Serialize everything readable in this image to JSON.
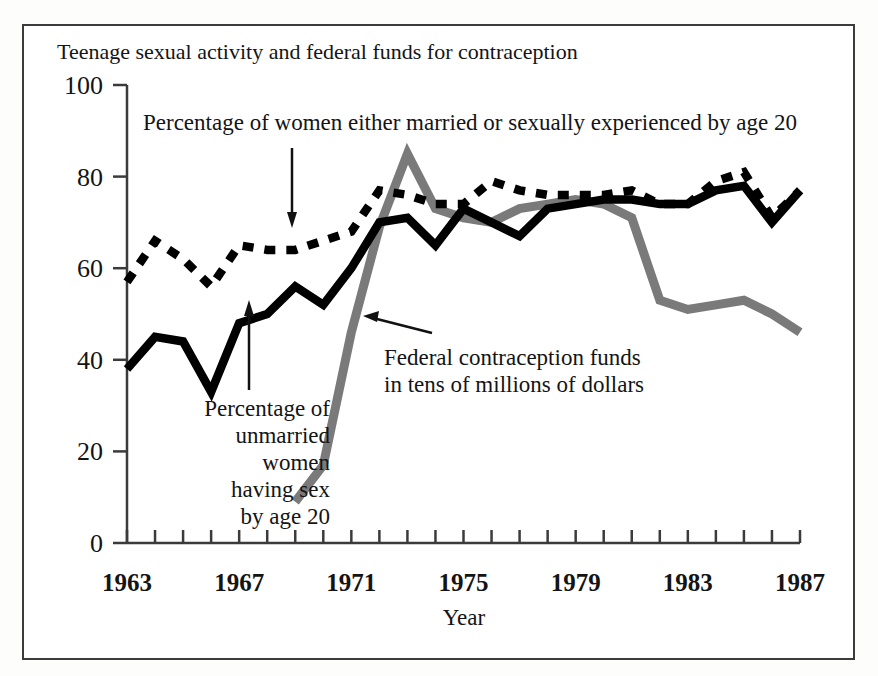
{
  "figure": {
    "title": "Teenage sexual activity and federal funds for contraception",
    "xlabel": "Year",
    "background_color": "#ffffff",
    "frame_color": "#3b3b3b"
  },
  "annotations": {
    "married_label_line1": "Percentage of women either married or sexually experienced by age 20",
    "unmarried_label_line1": "Percentage of",
    "unmarried_label_line2": "unmarried",
    "unmarried_label_line3": "women",
    "unmarried_label_line4": "having sex",
    "unmarried_label_line5": "by age 20",
    "funds_label_line1": "Federal contraception funds",
    "funds_label_line2": "in tens of millions of dollars"
  },
  "axis": {
    "y_ticks": [
      "0",
      "20",
      "40",
      "60",
      "80",
      "100"
    ],
    "y_tick_values": [
      0,
      20,
      40,
      60,
      80,
      100
    ],
    "x_ticks": [
      "1963",
      "1967",
      "1971",
      "1975",
      "1979",
      "1983",
      "1987"
    ],
    "x_tick_values": [
      1963,
      1967,
      1971,
      1975,
      1979,
      1983,
      1987
    ]
  },
  "chart_data": {
    "type": "line",
    "title": "Teenage sexual activity and federal funds for contraception",
    "xlabel": "Year",
    "ylabel": "",
    "xlim": [
      1963,
      1987
    ],
    "ylim": [
      0,
      100
    ],
    "grid": false,
    "legend": "annotations-inline",
    "x": [
      1963,
      1964,
      1965,
      1966,
      1967,
      1968,
      1969,
      1970,
      1971,
      1972,
      1973,
      1974,
      1975,
      1976,
      1977,
      1978,
      1979,
      1980,
      1981,
      1982,
      1983,
      1984,
      1985,
      1986,
      1987
    ],
    "series": [
      {
        "name": "Percentage of women either married or sexually experienced by age 20",
        "style": "dotted",
        "color": "#000000",
        "x": [
          1963,
          1964,
          1965,
          1966,
          1967,
          1968,
          1969,
          1970,
          1971,
          1972,
          1973,
          1974,
          1975,
          1976,
          1977,
          1978,
          1979,
          1980,
          1981,
          1982,
          1983,
          1984,
          1985,
          1986,
          1987
        ],
        "values": [
          57,
          66,
          62,
          56,
          65,
          64,
          64,
          66,
          68,
          77,
          76,
          74,
          74,
          79,
          77,
          76,
          76,
          76,
          77,
          74,
          74,
          79,
          81,
          71,
          77
        ]
      },
      {
        "name": "Percentage of unmarried women having sex by age 20",
        "style": "solid",
        "color": "#000000",
        "x": [
          1963,
          1964,
          1965,
          1966,
          1967,
          1968,
          1969,
          1970,
          1971,
          1972,
          1973,
          1974,
          1975,
          1976,
          1977,
          1978,
          1979,
          1980,
          1981,
          1982,
          1983,
          1984,
          1985,
          1986,
          1987
        ],
        "values": [
          38,
          45,
          44,
          33,
          48,
          50,
          56,
          52,
          60,
          70,
          71,
          65,
          73,
          70,
          67,
          73,
          74,
          75,
          75,
          74,
          74,
          77,
          78,
          70,
          77
        ]
      },
      {
        "name": "Federal contraception funds in tens of millions of dollars",
        "style": "solid-gray",
        "color": "#7a7a7a",
        "x": [
          1969,
          1970,
          1971,
          1972,
          1973,
          1974,
          1975,
          1976,
          1977,
          1978,
          1979,
          1980,
          1981,
          1982,
          1983,
          1984,
          1985,
          1986,
          1987
        ],
        "values": [
          9,
          17,
          46,
          69,
          85,
          73,
          71,
          70,
          73,
          74,
          75,
          74,
          71,
          53,
          51,
          52,
          53,
          50,
          46
        ]
      }
    ]
  }
}
